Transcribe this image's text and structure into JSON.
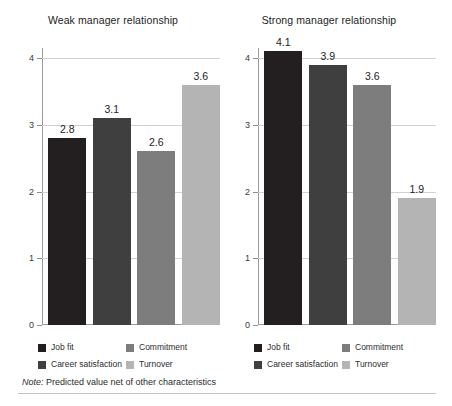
{
  "figure": {
    "note_label": "Note:",
    "note_text": " Predicted value net of other characteristics"
  },
  "colors": {
    "job_fit": "#231f20",
    "career_satisfaction": "#3f3f3f",
    "commitment": "#7d7d7d",
    "turnover": "#b4b4b4",
    "axis": "#9a9a9a",
    "gridline": "#d2d2d2",
    "text": "#2b2b2b"
  },
  "legend": {
    "items": [
      {
        "label": "Job fit",
        "color": "#231f20"
      },
      {
        "label": "Career satisfaction",
        "color": "#3f3f3f"
      },
      {
        "label": "Commitment",
        "color": "#7d7d7d"
      },
      {
        "label": "Turnover",
        "color": "#b4b4b4"
      }
    ]
  },
  "axis": {
    "ticks": [
      "0",
      "1",
      "2",
      "3",
      "4"
    ]
  },
  "chart_data": [
    {
      "type": "bar",
      "title": "Weak manager relationship",
      "categories": [
        "Job fit",
        "Career satisfaction",
        "Commitment",
        "Turnover"
      ],
      "values": [
        2.8,
        3.1,
        2.6,
        3.6
      ],
      "labels": [
        "2.8",
        "3.1",
        "2.6",
        "3.6"
      ],
      "colors": [
        "#231f20",
        "#3f3f3f",
        "#7d7d7d",
        "#b4b4b4"
      ],
      "xlabel": "",
      "ylabel": "",
      "ylim": [
        0,
        4.15
      ],
      "yticks": [
        0,
        1,
        2,
        3,
        4
      ],
      "ytick_labels": [
        "0",
        "1",
        "2",
        "3",
        "4"
      ],
      "grid": true,
      "legend_position": "bottom"
    },
    {
      "type": "bar",
      "title": "Strong manager relationship",
      "categories": [
        "Job fit",
        "Career satisfaction",
        "Commitment",
        "Turnover"
      ],
      "values": [
        4.1,
        3.9,
        3.6,
        1.9
      ],
      "labels": [
        "4.1",
        "3.9",
        "3.6",
        "1.9"
      ],
      "colors": [
        "#231f20",
        "#3f3f3f",
        "#7d7d7d",
        "#b4b4b4"
      ],
      "xlabel": "",
      "ylabel": "",
      "ylim": [
        0,
        4.15
      ],
      "yticks": [
        0,
        1,
        2,
        3,
        4
      ],
      "ytick_labels": [
        "0",
        "1",
        "2",
        "3",
        "4"
      ],
      "grid": true,
      "legend_position": "bottom"
    }
  ]
}
